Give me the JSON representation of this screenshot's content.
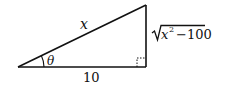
{
  "diagram": {
    "type": "right-triangle",
    "hypotenuse_label": "x",
    "adjacent_label": "10",
    "opposite_label": "x² − 100",
    "opposite_radical": "√",
    "opposite_var": "x",
    "opposite_exp": "2",
    "opposite_rest": "−100",
    "angle_label": "θ",
    "right_angle_marker": true,
    "stroke_color": "#111111"
  }
}
